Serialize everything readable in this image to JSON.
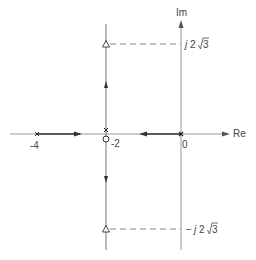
{
  "diagram": {
    "axes": {
      "real_label": "Re",
      "imag_label": "Im"
    },
    "real_axis_ticks": [
      {
        "label": "-4",
        "value": -4
      },
      {
        "label": "-2",
        "value": -2
      },
      {
        "label": "0",
        "value": 0
      }
    ],
    "imag_markers": [
      {
        "label_j": "j",
        "label_num": "2",
        "label_root": "3",
        "prefix": "",
        "value": "j2√3"
      },
      {
        "label_j": "j",
        "label_num": "2",
        "label_root": "3",
        "prefix": "−",
        "value": "−j2√3"
      }
    ],
    "poles": [
      {
        "position": "-4",
        "marker": "x"
      },
      {
        "position": "0",
        "marker": "x"
      },
      {
        "position": "-2",
        "marker": "x"
      }
    ],
    "zeros": [
      {
        "position": "-2",
        "marker": "o"
      }
    ],
    "triangles": [
      {
        "position": "-2 + j2√3",
        "marker": "triangle"
      },
      {
        "position": "-2 - j2√3",
        "marker": "triangle"
      }
    ],
    "colors": {
      "axis": "#888888",
      "locus": "#333333",
      "dashed": "#666666",
      "text": "#444444"
    }
  }
}
